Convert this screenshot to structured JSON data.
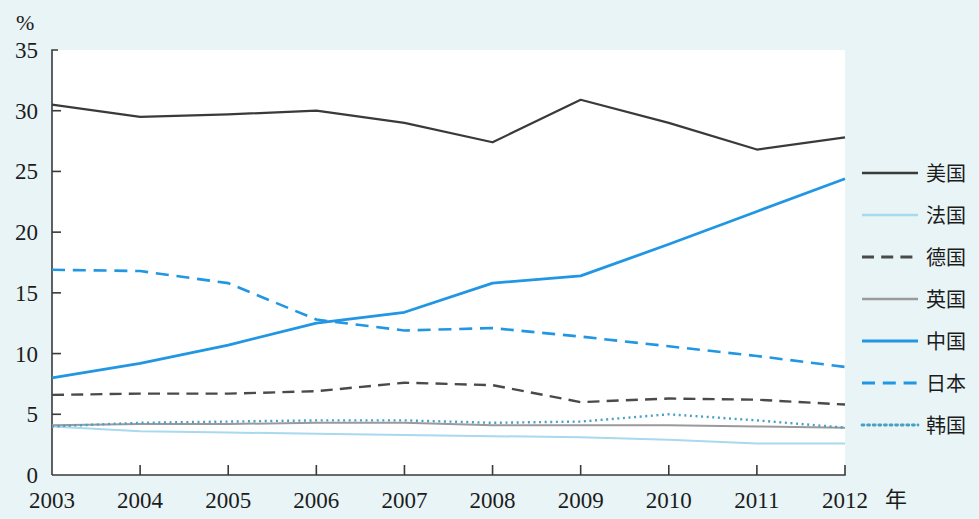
{
  "chart_data": {
    "type": "line",
    "title": "",
    "subtitle": "",
    "xlabel": "年",
    "ylabel": "%",
    "x": [
      2003,
      2004,
      2005,
      2006,
      2007,
      2008,
      2009,
      2010,
      2011,
      2012
    ],
    "categories": [
      "2003",
      "2004",
      "2005",
      "2006",
      "2007",
      "2008",
      "2009",
      "2010",
      "2011",
      "2012"
    ],
    "xlim": [
      2003,
      2012
    ],
    "ylim": [
      0,
      35
    ],
    "yticks": [
      0,
      5,
      10,
      15,
      20,
      25,
      30,
      35
    ],
    "ytick_labels": [
      "0",
      "5",
      "10",
      "15",
      "20",
      "25",
      "30",
      "35"
    ],
    "grid": false,
    "legend_position": "right",
    "series": [
      {
        "name": "美国",
        "color": "#3a3a3a",
        "style": "solid",
        "width": 2.2,
        "values": [
          30.5,
          29.5,
          29.7,
          30.0,
          29.0,
          27.4,
          30.9,
          29.0,
          26.8,
          27.8
        ]
      },
      {
        "name": "法国",
        "color": "#a9d9ec",
        "style": "solid",
        "width": 2.0,
        "values": [
          4.0,
          3.6,
          3.5,
          3.4,
          3.3,
          3.2,
          3.1,
          2.9,
          2.6,
          2.6
        ]
      },
      {
        "name": "德国",
        "color": "#4a4a4a",
        "style": "dashed",
        "width": 2.4,
        "values": [
          6.6,
          6.7,
          6.7,
          6.9,
          7.6,
          7.4,
          6.0,
          6.3,
          6.2,
          5.8
        ]
      },
      {
        "name": "英国",
        "color": "#9a9a9a",
        "style": "solid",
        "width": 2.0,
        "values": [
          4.1,
          4.2,
          4.2,
          4.3,
          4.3,
          4.1,
          4.1,
          4.1,
          4.0,
          3.9
        ]
      },
      {
        "name": "中国",
        "color": "#2196e3",
        "style": "solid",
        "width": 2.8,
        "values": [
          8.0,
          9.2,
          10.7,
          12.5,
          13.4,
          15.8,
          16.4,
          19.0,
          21.7,
          24.4
        ]
      },
      {
        "name": "日本",
        "color": "#2196e3",
        "style": "dashed",
        "width": 2.6,
        "values": [
          16.9,
          16.8,
          15.8,
          12.8,
          11.9,
          12.1,
          11.4,
          10.6,
          9.8,
          8.9
        ]
      },
      {
        "name": "韩国",
        "color": "#4a9fc4",
        "style": "dotted",
        "width": 2.4,
        "values": [
          4.0,
          4.3,
          4.4,
          4.5,
          4.5,
          4.3,
          4.4,
          5.0,
          4.5,
          3.9
        ]
      }
    ]
  },
  "legend": {
    "items": [
      {
        "label": "美国"
      },
      {
        "label": "法国"
      },
      {
        "label": "德国"
      },
      {
        "label": "英国"
      },
      {
        "label": "中国"
      },
      {
        "label": "日本"
      },
      {
        "label": "韩国"
      }
    ]
  },
  "colors": {
    "background": "#e8f4f6",
    "plot_background": "#ffffff",
    "axis": "#3a3a3a",
    "usa": "#3a3a3a",
    "france": "#a9d9ec",
    "germany": "#4a4a4a",
    "uk": "#9a9a9a",
    "china": "#2196e3",
    "japan": "#2196e3",
    "korea": "#4a9fc4"
  }
}
